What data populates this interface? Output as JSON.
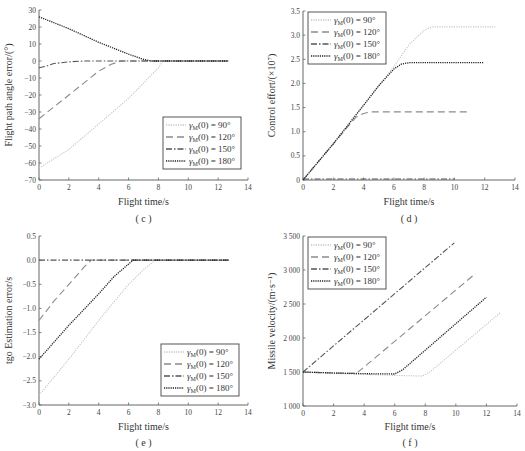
{
  "chart_data": [
    {
      "id": "c",
      "type": "line",
      "caption": "( c )",
      "xlabel": "Flight time/s",
      "ylabel": "Flight path angle error/(°)",
      "xlim": [
        0,
        14
      ],
      "ylim": [
        -70,
        30
      ],
      "xticks": [
        0,
        2,
        4,
        6,
        8,
        10,
        12,
        14
      ],
      "yticks": [
        30,
        20,
        10,
        0,
        -10,
        -20,
        -30,
        -40,
        -50,
        -60,
        -70
      ],
      "legend_position": "lower right",
      "series": [
        {
          "name": "γM(0) = 90°",
          "style": "dotted-light",
          "x": [
            0,
            2,
            4,
            6,
            7,
            8,
            8.3,
            12.7
          ],
          "y": [
            -63,
            -52,
            -37,
            -22,
            -13,
            -4,
            0,
            0
          ]
        },
        {
          "name": "γM(0) = 120°",
          "style": "dashed",
          "x": [
            0,
            1,
            2,
            3,
            4,
            4.8,
            5.5,
            12.7
          ],
          "y": [
            -34,
            -27,
            -20,
            -13,
            -6,
            -2,
            0,
            0
          ]
        },
        {
          "name": "γM(0) = 150°",
          "style": "dashdot",
          "x": [
            0,
            0.5,
            1,
            2,
            3,
            12.7
          ],
          "y": [
            -4,
            -3,
            -1.5,
            -0.5,
            0,
            0
          ]
        },
        {
          "name": "γM(0) = 180°",
          "style": "dotted-dark",
          "x": [
            0,
            2,
            4,
            6,
            7,
            7.5,
            12.7
          ],
          "y": [
            26,
            19,
            11,
            4,
            1,
            0,
            0
          ]
        }
      ]
    },
    {
      "id": "d",
      "type": "line",
      "caption": "( d )",
      "xlabel": "Flight time/s",
      "ylabel": "Control effort/(×10⁷)",
      "xlim": [
        0,
        14
      ],
      "ylim": [
        0,
        3.5
      ],
      "xticks": [
        0,
        2,
        4,
        6,
        8,
        10,
        12,
        14
      ],
      "yticks": [
        0,
        0.5,
        1.0,
        1.5,
        2.0,
        2.5,
        3.0,
        3.5
      ],
      "legend_position": "upper left",
      "series": [
        {
          "name": "γM(0) = 90°",
          "style": "dotted-light",
          "x": [
            0,
            2,
            4,
            6,
            7,
            8,
            8.5,
            12.7
          ],
          "y": [
            0,
            0.75,
            1.55,
            2.35,
            2.8,
            3.1,
            3.17,
            3.17
          ]
        },
        {
          "name": "γM(0) = 120°",
          "style": "dashed",
          "x": [
            0,
            2,
            3.5,
            4,
            4.5,
            11
          ],
          "y": [
            0,
            0.75,
            1.3,
            1.38,
            1.41,
            1.41
          ]
        },
        {
          "name": "γM(0) = 150°",
          "style": "dashdot",
          "x": [
            0,
            10
          ],
          "y": [
            0.02,
            0.02
          ]
        },
        {
          "name": "γM(0) = 180°",
          "style": "dotted-dark",
          "x": [
            0,
            2,
            4,
            5,
            6,
            6.5,
            7,
            11.9
          ],
          "y": [
            0,
            0.75,
            1.55,
            1.95,
            2.3,
            2.4,
            2.43,
            2.43
          ]
        }
      ]
    },
    {
      "id": "e",
      "type": "line",
      "caption": "( e )",
      "xlabel": "Flight time/s",
      "ylabel": "tgo Estimation error/s",
      "xlim": [
        0,
        14
      ],
      "ylim": [
        -3.0,
        0.5
      ],
      "xticks": [
        0,
        2,
        4,
        6,
        8,
        10,
        12,
        14
      ],
      "yticks": [
        0.5,
        0.0,
        -0.5,
        -1.0,
        -1.5,
        -2.0,
        -2.5,
        -3.0
      ],
      "legend_position": "lower right",
      "series": [
        {
          "name": "γM(0) = 90°",
          "style": "dotted-light",
          "x": [
            0,
            2,
            4,
            6,
            7,
            7.8,
            12.7
          ],
          "y": [
            -2.8,
            -2.05,
            -1.25,
            -0.5,
            -0.2,
            0,
            0
          ]
        },
        {
          "name": "γM(0) = 120°",
          "style": "dashed",
          "x": [
            0,
            1,
            2,
            3,
            3.5,
            12.7
          ],
          "y": [
            -1.25,
            -0.85,
            -0.5,
            -0.15,
            0,
            0
          ]
        },
        {
          "name": "γM(0) = 150°",
          "style": "dashdot",
          "x": [
            0,
            12.7
          ],
          "y": [
            0,
            0
          ]
        },
        {
          "name": "γM(0) = 180°",
          "style": "dotted-dark",
          "x": [
            0,
            2,
            4,
            5,
            6,
            6.3,
            12.7
          ],
          "y": [
            -2.05,
            -1.35,
            -0.7,
            -0.35,
            -0.08,
            0,
            0
          ]
        }
      ]
    },
    {
      "id": "f",
      "type": "line",
      "caption": "( f )",
      "xlabel": "Flight time/s",
      "ylabel": "Missile velocity/(m·s⁻¹)",
      "xlim": [
        0,
        14
      ],
      "ylim": [
        1000,
        3500
      ],
      "xticks": [
        0,
        2,
        4,
        6,
        8,
        10,
        12,
        14
      ],
      "yticks": [
        1000,
        1500,
        2000,
        2500,
        3000,
        3500
      ],
      "ytick_labels": [
        "1 000",
        "1 500",
        "2 000",
        "2 500",
        "3 000",
        "3 500"
      ],
      "legend_position": "upper left",
      "series": [
        {
          "name": "γM(0) = 90°",
          "style": "dotted-light",
          "x": [
            0,
            2,
            4,
            6,
            7.8,
            8.3,
            12.9
          ],
          "y": [
            1500,
            1480,
            1465,
            1450,
            1440,
            1500,
            2370
          ]
        },
        {
          "name": "γM(0) = 120°",
          "style": "dashed",
          "x": [
            0,
            2,
            3.5,
            11.3
          ],
          "y": [
            1500,
            1485,
            1480,
            2950
          ]
        },
        {
          "name": "γM(0) = 150°",
          "style": "dashdot",
          "x": [
            0,
            9.9
          ],
          "y": [
            1500,
            3400
          ]
        },
        {
          "name": "γM(0) = 180°",
          "style": "dotted-dark",
          "x": [
            0,
            2,
            4,
            6,
            6.5,
            12
          ],
          "y": [
            1500,
            1485,
            1475,
            1470,
            1530,
            2600
          ]
        }
      ]
    }
  ],
  "legend_labels": [
    "γM(0) = 90°",
    "γM(0) = 120°",
    "γM(0) = 150°",
    "γM(0) = 180°"
  ],
  "captions": {
    "c": "( c )",
    "d": "( d )",
    "e": "( e )",
    "f": "( f )"
  },
  "axis_titles": {
    "x": "Flight time/s",
    "c_y": "Flight path angle error/(°)",
    "d_y": "Control effort/(×10⁷)",
    "e_y": "tgo Estimation error/s",
    "f_y": "Missile velocity/(m·s⁻¹)"
  }
}
